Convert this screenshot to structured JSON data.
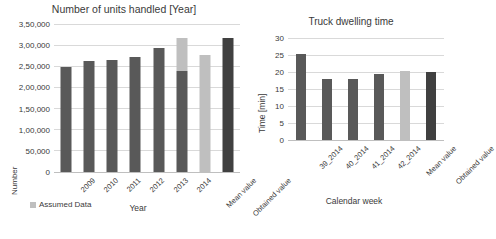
{
  "figure": {
    "background": "#ffffff",
    "panels": [
      "units-handled",
      "truck-dwelling-time"
    ]
  },
  "colors": {
    "bar_default": "#595959",
    "bar_light": "#bfbfbf",
    "bar_dark": "#404040",
    "gridline": "#d9d9d9",
    "text": "#3a3a3a"
  },
  "chart_data": [
    {
      "id": "units-handled",
      "type": "bar",
      "title": "Number of units handled [Year]",
      "xlabel": "Year",
      "ylabel": "Number",
      "ylim": [
        0,
        350000
      ],
      "grid": true,
      "legend_position": "bottom-left",
      "legend": [
        {
          "label": "Assumed Data",
          "color": "#bfbfbf"
        }
      ],
      "yticks": [
        0,
        50000,
        100000,
        150000,
        200000,
        250000,
        300000,
        350000
      ],
      "ytick_labels": [
        "0",
        "50,000",
        "1,00,000",
        "1,50,000",
        "2,00,000",
        "2,50,000",
        "3,00,000",
        "3,50,000"
      ],
      "categories": [
        "2009",
        "2010",
        "2011",
        "2012",
        "2013",
        "2014",
        "Mean value",
        "Obtained value"
      ],
      "series": [
        {
          "name": "Units handled",
          "values": [
            248000,
            263000,
            265000,
            271000,
            294000,
            238000,
            277000,
            317000
          ],
          "colors": [
            "#595959",
            "#595959",
            "#595959",
            "#595959",
            "#595959",
            "#595959",
            "#bfbfbf",
            "#404040"
          ]
        },
        {
          "name": "Assumed Data",
          "values": [
            0,
            0,
            0,
            0,
            0,
            78000,
            0,
            0
          ],
          "colors": [
            "#bfbfbf",
            "#bfbfbf",
            "#bfbfbf",
            "#bfbfbf",
            "#bfbfbf",
            "#bfbfbf",
            "#bfbfbf",
            "#bfbfbf"
          ]
        }
      ]
    },
    {
      "id": "truck-dwelling-time",
      "type": "bar",
      "title": "Truck dwelling time",
      "xlabel": "Calendar week",
      "ylabel": "Time [min]",
      "ylim": [
        0,
        30
      ],
      "grid": true,
      "yticks": [
        0,
        5,
        10,
        15,
        20,
        25,
        30
      ],
      "ytick_labels": [
        "0",
        "5",
        "10",
        "15",
        "20",
        "25",
        "30"
      ],
      "categories": [
        "39_2014",
        "40_2014",
        "41_2014",
        "42_2014",
        "Mean value",
        "Obtained value"
      ],
      "series": [
        {
          "name": "Dwelling time",
          "values": [
            25.3,
            18.0,
            17.8,
            19.5,
            20.2,
            20.0
          ],
          "colors": [
            "#595959",
            "#595959",
            "#595959",
            "#595959",
            "#bfbfbf",
            "#404040"
          ]
        }
      ]
    }
  ]
}
